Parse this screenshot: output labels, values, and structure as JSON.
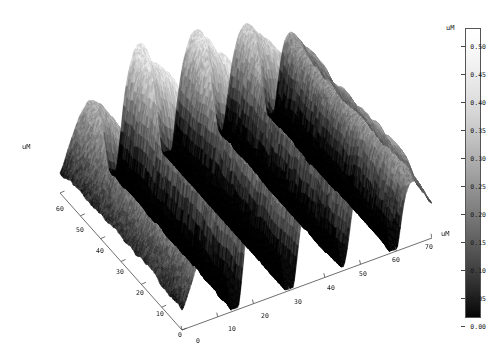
{
  "figure": {
    "type": "3d-surface-plot",
    "background_color": "#ffffff",
    "render_style": "grayscale-noisy-afm-topography"
  },
  "axes": {
    "left_axis": {
      "label": "uM",
      "ticks": [
        "60",
        "50",
        "40",
        "30",
        "20",
        "10",
        "0"
      ],
      "range": [
        0,
        60
      ]
    },
    "right_axis": {
      "label": "uM",
      "ticks": [
        "0",
        "10",
        "20",
        "30",
        "40",
        "50",
        "60",
        "70"
      ],
      "range": [
        0,
        70
      ]
    },
    "vertical_axis": {
      "label": "uM"
    }
  },
  "colorbar": {
    "unit_label": "uM",
    "ticks": [
      "0.50",
      "0.45",
      "0.40",
      "0.35",
      "0.30",
      "0.25",
      "0.20",
      "0.15",
      "0.10",
      "0.05",
      "0.00"
    ],
    "min": "0.00",
    "max": "0.50",
    "gradient_top_color": "#ffffff",
    "gradient_bottom_color": "#000000",
    "orientation": "vertical"
  },
  "chart_data": {
    "type": "heatmap",
    "title": "",
    "xlabel": "uM",
    "ylabel": "uM",
    "zlabel": "uM",
    "xlim": [
      0,
      70
    ],
    "ylim": [
      0,
      60
    ],
    "zlim": [
      0.0,
      0.5
    ],
    "grid": false,
    "legend_position": "right",
    "colormap": "gray",
    "x_ticks": [
      0,
      10,
      20,
      30,
      40,
      50,
      60,
      70
    ],
    "y_ticks": [
      0,
      10,
      20,
      30,
      40,
      50,
      60
    ],
    "z_ticks": [
      0.0,
      0.05,
      0.1,
      0.15,
      0.2,
      0.25,
      0.3,
      0.35,
      0.4,
      0.45,
      0.5
    ],
    "ridge_peak_heights": [
      0.34,
      0.5,
      0.47,
      0.43,
      0.3
    ],
    "valley_floor_depths": [
      0.02,
      0.01,
      0.02
    ],
    "ridge_positions_x": [
      8,
      22,
      38,
      52,
      65
    ],
    "valley_positions_x": [
      15,
      30,
      45,
      59
    ],
    "mean_height": 0.27,
    "surface_roughness": "high"
  }
}
